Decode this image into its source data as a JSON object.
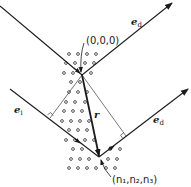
{
  "diagram": {
    "type": "scattering geometry",
    "labels": {
      "origin": "(0,0,0)",
      "lattice_point": "(n₁,n₂,n₃)",
      "incident_vector": "e",
      "incident_sub": "i",
      "diffracted_vector": "e",
      "diffracted_sub": "d",
      "position_vector": "r"
    },
    "colors": {
      "line": "#1a1a1a",
      "thin_line": "#555555",
      "dot": "#444444",
      "background": "#ffffff"
    }
  }
}
